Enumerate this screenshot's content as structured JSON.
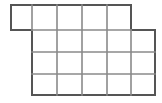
{
  "figure": {
    "kind": "line-drawing",
    "canvas": {
      "width": 162,
      "height": 103,
      "background_color": "#ffffff"
    },
    "style": {
      "line_color": "#555555",
      "line_color_light": "#8a8a8a",
      "line_width": 2,
      "cell_fill": "#ffffff"
    },
    "geometry": {
      "x_coords": [
        11,
        32,
        57,
        82,
        107,
        131,
        155
      ],
      "y_coords": [
        5,
        30,
        52,
        74,
        95
      ],
      "cell_width_nominal": 25,
      "cell_height_nominal": 22
    },
    "regions": [
      {
        "name": "top-row",
        "columns": 5,
        "rows": 1,
        "x_start": 11,
        "x_end": 131,
        "y_start": 5,
        "y_end": 30
      },
      {
        "name": "lower-block",
        "columns": 5,
        "rows": 3,
        "x_start": 32,
        "x_end": 155,
        "y_start": 30,
        "y_end": 95
      }
    ],
    "cells": [
      {
        "row": 0,
        "col": 0,
        "x": 11,
        "y": 5,
        "w": 21,
        "h": 25
      },
      {
        "row": 0,
        "col": 1,
        "x": 32,
        "y": 5,
        "w": 25,
        "h": 25
      },
      {
        "row": 0,
        "col": 2,
        "x": 57,
        "y": 5,
        "w": 25,
        "h": 25
      },
      {
        "row": 0,
        "col": 3,
        "x": 82,
        "y": 5,
        "w": 25,
        "h": 25
      },
      {
        "row": 0,
        "col": 4,
        "x": 107,
        "y": 5,
        "w": 24,
        "h": 25
      },
      {
        "row": 1,
        "col": 0,
        "x": 32,
        "y": 30,
        "w": 25,
        "h": 22
      },
      {
        "row": 1,
        "col": 1,
        "x": 57,
        "y": 30,
        "w": 25,
        "h": 22
      },
      {
        "row": 1,
        "col": 2,
        "x": 82,
        "y": 30,
        "w": 25,
        "h": 22
      },
      {
        "row": 1,
        "col": 3,
        "x": 107,
        "y": 30,
        "w": 24,
        "h": 22
      },
      {
        "row": 1,
        "col": 4,
        "x": 131,
        "y": 30,
        "w": 24,
        "h": 22
      },
      {
        "row": 2,
        "col": 0,
        "x": 32,
        "y": 52,
        "w": 25,
        "h": 22
      },
      {
        "row": 2,
        "col": 1,
        "x": 57,
        "y": 52,
        "w": 25,
        "h": 22
      },
      {
        "row": 2,
        "col": 2,
        "x": 82,
        "y": 52,
        "w": 25,
        "h": 22
      },
      {
        "row": 2,
        "col": 3,
        "x": 107,
        "y": 52,
        "w": 24,
        "h": 22
      },
      {
        "row": 2,
        "col": 4,
        "x": 131,
        "y": 52,
        "w": 24,
        "h": 22
      },
      {
        "row": 3,
        "col": 0,
        "x": 32,
        "y": 74,
        "w": 25,
        "h": 21
      },
      {
        "row": 3,
        "col": 1,
        "x": 57,
        "y": 74,
        "w": 25,
        "h": 21
      },
      {
        "row": 3,
        "col": 2,
        "x": 82,
        "y": 74,
        "w": 25,
        "h": 21
      },
      {
        "row": 3,
        "col": 3,
        "x": 107,
        "y": 74,
        "w": 24,
        "h": 21
      },
      {
        "row": 3,
        "col": 4,
        "x": 131,
        "y": 74,
        "w": 24,
        "h": 21
      }
    ],
    "total_cells": 20,
    "outline_path": "M 11 5 L 131 5 L 131 30 L 155 30 L 155 95 L 32 95 L 32 30 L 11 30 Z",
    "segments": [
      {
        "name": "top-edge",
        "x1": 11,
        "y1": 5,
        "x2": 131,
        "y2": 5,
        "weight": "outline"
      },
      {
        "name": "top-row-left-edge",
        "x1": 11,
        "y1": 5,
        "x2": 11,
        "y2": 30,
        "weight": "outline"
      },
      {
        "name": "top-row-bottom-left",
        "x1": 11,
        "y1": 30,
        "x2": 32,
        "y2": 30,
        "weight": "outline"
      },
      {
        "name": "lower-left-edge",
        "x1": 32,
        "y1": 30,
        "x2": 32,
        "y2": 95,
        "weight": "outline"
      },
      {
        "name": "bottom-edge",
        "x1": 32,
        "y1": 95,
        "x2": 155,
        "y2": 95,
        "weight": "outline"
      },
      {
        "name": "lower-right-edge",
        "x1": 155,
        "y1": 30,
        "x2": 155,
        "y2": 95,
        "weight": "outline"
      },
      {
        "name": "step-top-edge",
        "x1": 131,
        "y1": 30,
        "x2": 155,
        "y2": 30,
        "weight": "outline"
      },
      {
        "name": "top-row-right-edge",
        "x1": 131,
        "y1": 5,
        "x2": 131,
        "y2": 30,
        "weight": "outline"
      },
      {
        "name": "h-divider-row1",
        "x1": 32,
        "y1": 30,
        "x2": 131,
        "y2": 30,
        "weight": "inner"
      },
      {
        "name": "h-divider-row2",
        "x1": 32,
        "y1": 52,
        "x2": 155,
        "y2": 52,
        "weight": "inner"
      },
      {
        "name": "h-divider-row3",
        "x1": 32,
        "y1": 74,
        "x2": 155,
        "y2": 74,
        "weight": "inner"
      },
      {
        "name": "v-divider-x32-top",
        "x1": 32,
        "y1": 5,
        "x2": 32,
        "y2": 30,
        "weight": "inner"
      },
      {
        "name": "v-divider-x57",
        "x1": 57,
        "y1": 5,
        "x2": 57,
        "y2": 95,
        "weight": "inner"
      },
      {
        "name": "v-divider-x82",
        "x1": 82,
        "y1": 5,
        "x2": 82,
        "y2": 95,
        "weight": "inner"
      },
      {
        "name": "v-divider-x107",
        "x1": 107,
        "y1": 5,
        "x2": 107,
        "y2": 95,
        "weight": "inner"
      },
      {
        "name": "v-divider-x131-low",
        "x1": 131,
        "y1": 30,
        "x2": 131,
        "y2": 95,
        "weight": "inner"
      }
    ]
  }
}
